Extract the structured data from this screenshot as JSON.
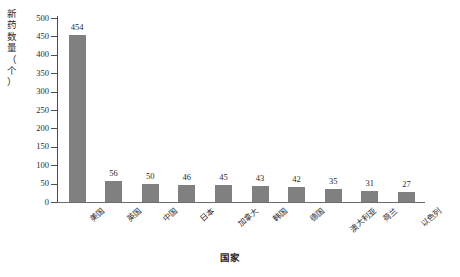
{
  "chart_data": {
    "type": "bar",
    "title": "",
    "xlabel": "国家",
    "ylabel": "新药数量（个）",
    "ylabel_chars": "新\n药\n数\n量\n（\n个\n）",
    "categories": [
      "美国",
      "英国",
      "中国",
      "日本",
      "加拿大",
      "韩国",
      "德国",
      "澳大利亚",
      "荷兰",
      "以色列"
    ],
    "values": [
      454,
      56,
      50,
      46,
      45,
      43,
      42,
      35,
      31,
      27
    ],
    "value_labels": [
      "454",
      "56",
      "50",
      "46",
      "45",
      "43",
      "42",
      "35",
      "31",
      "27"
    ],
    "ylim": [
      0,
      500
    ],
    "ytick_step": 50,
    "ytick_labels": [
      "500",
      "450",
      "400",
      "350",
      "300",
      "250",
      "200",
      "150",
      "100",
      "50",
      "0"
    ],
    "ytick_values": [
      500,
      450,
      400,
      350,
      300,
      250,
      200,
      150,
      100,
      50,
      0
    ],
    "grid": false,
    "legend": false,
    "bar_color": "#808080",
    "axis_color": "#4d4d4d",
    "background_color": "#ffffff",
    "text_color": "#2b2b2b"
  }
}
